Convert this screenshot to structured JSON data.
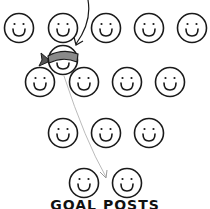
{
  "diagram": {
    "label": "GOAL POSTS",
    "colors": {
      "stroke": "#1a1a1a",
      "blindfold": "#8a8a8a",
      "guide_arrow": "#bbbbbb"
    },
    "faces": [
      {
        "x": 19,
        "y": 28
      },
      {
        "x": 63,
        "y": 28
      },
      {
        "x": 106,
        "y": 28
      },
      {
        "x": 149,
        "y": 28
      },
      {
        "x": 192,
        "y": 28
      },
      {
        "x": 40,
        "y": 82
      },
      {
        "x": 84,
        "y": 82
      },
      {
        "x": 127,
        "y": 82
      },
      {
        "x": 170,
        "y": 82
      },
      {
        "x": 63,
        "y": 133
      },
      {
        "x": 106,
        "y": 133
      },
      {
        "x": 149,
        "y": 133
      },
      {
        "x": 84,
        "y": 183
      },
      {
        "x": 127,
        "y": 183
      }
    ],
    "blindfolded_face": {
      "x": 63,
      "y": 60
    }
  }
}
